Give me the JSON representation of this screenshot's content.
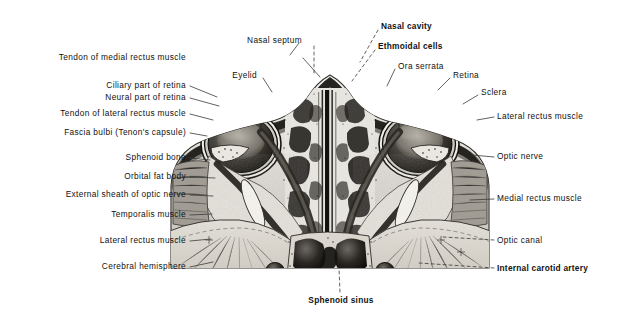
{
  "figure": {
    "kind": "anatomical-illustration",
    "palette": {
      "background": "#ffffff",
      "ink": "#111111",
      "leader": "#3a3a3a",
      "bone_light": "#e8e6e1",
      "soft_tissue": "#bdbab3",
      "muscle": "#8e8a83",
      "cavity_dark": "#1b1b1b",
      "globe_dark": "#2a2724",
      "fat_pale": "#efede8"
    }
  },
  "labels": {
    "left": [
      {
        "id": "tendon-of-medial-rectus-muscle",
        "text": "Tendon of medial rectus muscle",
        "bold": false,
        "x": 300,
        "y": 57,
        "tipX": 320,
        "tipY": 77
      },
      {
        "id": "ciliary-part-of-retina",
        "text": "Ciliary part of retina",
        "bold": false,
        "x": 186,
        "y": 85,
        "tipX": 218,
        "tipY": 97
      },
      {
        "id": "neural-part-of-retina",
        "text": "Neural part of retina",
        "bold": false,
        "x": 186,
        "y": 97,
        "tipX": 220,
        "tipY": 106
      },
      {
        "id": "tendon-of-lateral-rectus-muscle",
        "text": "Tendon of lateral rectus muscle",
        "bold": false,
        "x": 186,
        "y": 113,
        "tipX": 214,
        "tipY": 120
      },
      {
        "id": "fascia-bulbi-tenons-capsule",
        "text": "Fascia bulbi (Tenon's capsule)",
        "bold": false,
        "x": 186,
        "y": 132,
        "tipX": 208,
        "tipY": 136
      },
      {
        "id": "sphenoid-bone",
        "text": "Sphenoid bone",
        "bold": false,
        "x": 186,
        "y": 157,
        "tipX": 211,
        "tipY": 160
      },
      {
        "id": "orbital-fat-body",
        "text": "Orbital fat body",
        "bold": false,
        "x": 186,
        "y": 176,
        "tipX": 216,
        "tipY": 178
      },
      {
        "id": "external-sheath-of-optic-nerve",
        "text": "External sheath of optic nerve",
        "bold": false,
        "x": 186,
        "y": 194,
        "tipX": 214,
        "tipY": 196
      },
      {
        "id": "temporalis-muscle",
        "text": "Temporalis muscle",
        "bold": false,
        "x": 186,
        "y": 214,
        "tipX": 213,
        "tipY": 214
      },
      {
        "id": "lateral-rectus-muscle-left",
        "text": "Lateral rectus muscle",
        "bold": false,
        "x": 186,
        "y": 240,
        "tipX": 212,
        "tipY": 239
      },
      {
        "id": "cerebral-hemisphere",
        "text": "Cerebral hemisphere",
        "bold": false,
        "x": 186,
        "y": 266,
        "tipX": 214,
        "tipY": 262
      }
    ],
    "leftTop": [
      {
        "id": "nasal-septum",
        "text": "Nasal septum",
        "bold": false,
        "x": 302,
        "y": 40,
        "tipX": 313,
        "tipY": 76
      },
      {
        "id": "eyelid",
        "text": "Eyelid",
        "bold": false,
        "x": 257,
        "y": 75,
        "tipX": 272,
        "tipY": 93
      }
    ],
    "right": [
      {
        "id": "nasal-cavity",
        "text": "Nasal cavity",
        "bold": true,
        "x": 381,
        "y": 26,
        "tipX": 359,
        "tipY": 62
      },
      {
        "id": "ethmoidal-cells",
        "text": "Ethmoidal cells",
        "bold": true,
        "x": 378,
        "y": 46,
        "tipX": 352,
        "tipY": 82
      },
      {
        "id": "ora-serrata",
        "text": "Ora serrata",
        "bold": false,
        "x": 398,
        "y": 66,
        "tipX": 388,
        "tipY": 86
      },
      {
        "id": "retina",
        "text": "Retina",
        "bold": false,
        "x": 453,
        "y": 75,
        "tipX": 438,
        "tipY": 90
      },
      {
        "id": "sclera",
        "text": "Sclera",
        "bold": false,
        "x": 481,
        "y": 92,
        "tipX": 463,
        "tipY": 104
      },
      {
        "id": "lateral-rectus-muscle-right",
        "text": "Lateral rectus muscle",
        "bold": false,
        "x": 497,
        "y": 116,
        "tipX": 477,
        "tipY": 120
      },
      {
        "id": "optic-nerve",
        "text": "Optic nerve",
        "bold": false,
        "x": 497,
        "y": 156,
        "tipX": 472,
        "tipY": 155
      },
      {
        "id": "medial-rectus-muscle",
        "text": "Medial rectus muscle",
        "bold": false,
        "x": 497,
        "y": 198,
        "tipX": 470,
        "tipY": 200
      },
      {
        "id": "optic-canal",
        "text": "Optic canal",
        "bold": false,
        "x": 497,
        "y": 240,
        "tipX": 444,
        "tipY": 236
      },
      {
        "id": "internal-carotid-artery",
        "text": "Internal carotid artery",
        "bold": true,
        "x": 497,
        "y": 268,
        "tipX": 420,
        "tipY": 263
      }
    ],
    "bottom": [
      {
        "id": "sphenoid-sinus",
        "text": "Sphenoid  sinus",
        "bold": true,
        "x": 341,
        "y": 300,
        "tipX": 339,
        "tipY": 268
      }
    ]
  }
}
